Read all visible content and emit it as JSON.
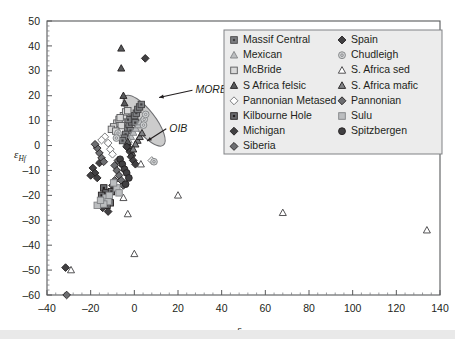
{
  "figure": {
    "type": "scatter-plot",
    "background": "#ffffff",
    "frame_color": "#58595b"
  },
  "chart_data": {
    "type": "scatter",
    "title": "",
    "xlabel": "εNd",
    "ylabel": "εHf",
    "xlabel_base": "ε",
    "xlabel_sub": "Nd",
    "ylabel_base": "ε",
    "ylabel_sub": "Hf",
    "xlim": [
      -40,
      140
    ],
    "ylim": [
      -60,
      50
    ],
    "xticks": [
      -40,
      -20,
      0,
      20,
      40,
      60,
      80,
      100,
      120,
      140
    ],
    "yticks": [
      -60,
      -50,
      -40,
      -30,
      -20,
      -10,
      0,
      10,
      20,
      30,
      40,
      50
    ],
    "xminor_step": 4,
    "yminor_step": 2,
    "grid": false,
    "legend_position": "top-right-inside",
    "annotations": [
      {
        "label": "MORB",
        "x": 28,
        "y": 21,
        "point_x": 9.5,
        "point_y": 18.5,
        "style": "italic"
      },
      {
        "label": "OIB",
        "x": 16,
        "y": 5.5,
        "point_x": 4.0,
        "point_y": 1.0,
        "style": "italic"
      }
    ],
    "shaded_field": {
      "name": "mantle-array-ellipse",
      "fill": "#c9c9c9",
      "stroke": "#6d6e71",
      "center_x": 4.5,
      "center_y": 10.0,
      "rx": 5.0,
      "ry": 12.5,
      "rotation_deg": -38
    },
    "series": [
      {
        "name": "Massif Central",
        "marker": "square-dot",
        "fill": "#808285",
        "stroke": "#414042",
        "points": [
          [
            -3,
            7
          ],
          [
            -2.4,
            8.5
          ],
          [
            -1.8,
            6
          ],
          [
            -1.2,
            9.5
          ],
          [
            -0.6,
            11
          ],
          [
            0.2,
            12
          ],
          [
            0.9,
            13
          ],
          [
            1.6,
            14.5
          ],
          [
            -4,
            4.5
          ],
          [
            -4.6,
            3
          ],
          [
            2.4,
            15.5
          ],
          [
            3.2,
            16.5
          ],
          [
            -5.4,
            2
          ],
          [
            -2.9,
            10.4
          ],
          [
            0.4,
            9.2
          ]
        ]
      },
      {
        "name": "Mexican",
        "marker": "triangle-light",
        "fill": "#bcbec0",
        "stroke": "#808285",
        "points": [
          [
            -1.5,
            3.5
          ],
          [
            -0.4,
            5.2
          ],
          [
            0.7,
            6.8
          ],
          [
            1.8,
            8.2
          ],
          [
            -2.6,
            2.2
          ],
          [
            2.8,
            9.4
          ],
          [
            -3.6,
            1.0
          ]
        ]
      },
      {
        "name": "McBride",
        "marker": "square-open",
        "fill": "#d9d9d9",
        "stroke": "#58595b",
        "points": [
          [
            -8,
            9
          ],
          [
            -7,
            10.5
          ],
          [
            -6,
            8
          ],
          [
            -9.5,
            7.5
          ],
          [
            -5,
            12
          ],
          [
            -4,
            13.5
          ],
          [
            -10.5,
            6.5
          ],
          [
            -3,
            14
          ],
          [
            -6.5,
            11.2
          ],
          [
            -8.5,
            5.8
          ]
        ]
      },
      {
        "name": "S Africa felsic",
        "marker": "triangle-dark",
        "fill": "#58595b",
        "stroke": "#231f20",
        "points": [
          [
            -6,
            39
          ],
          [
            -6,
            31
          ],
          [
            -5,
            20
          ],
          [
            -4.5,
            17
          ],
          [
            -3,
            1.5
          ],
          [
            -2,
            -1
          ],
          [
            -1,
            -3
          ]
        ]
      },
      {
        "name": "Pannonian Metased",
        "marker": "diamond-open",
        "fill": "#ffffff",
        "stroke": "#6d6e71",
        "points": [
          [
            -12,
            1
          ],
          [
            -13.5,
            3.5
          ],
          [
            -11,
            -1.5
          ],
          [
            8,
            -6
          ],
          [
            -15,
            2.2
          ],
          [
            -10,
            -3.5
          ]
        ]
      },
      {
        "name": "Kilbourne Hole",
        "marker": "square-dot-dark",
        "fill": "#6d6e71",
        "stroke": "#231f20",
        "points": [
          [
            -14,
            -17
          ],
          [
            -13,
            -19
          ],
          [
            -12,
            -21
          ],
          [
            -11,
            -23
          ],
          [
            -15,
            -20
          ],
          [
            -12.5,
            -24
          ],
          [
            -10.5,
            -18.5
          ]
        ]
      },
      {
        "name": "Michigan",
        "marker": "diamond-dark",
        "fill": "#414042",
        "stroke": "#231f20",
        "points": [
          [
            -19,
            -9
          ],
          [
            -18,
            -11
          ],
          [
            -17,
            -13
          ],
          [
            -16,
            -7
          ],
          [
            -20,
            -12
          ],
          [
            -13,
            -22
          ],
          [
            -14.5,
            -25
          ],
          [
            -12,
            -26.5
          ],
          [
            -31.5,
            -49
          ],
          [
            -10,
            -16
          ]
        ]
      },
      {
        "name": "Siberia",
        "marker": "diamond-mid",
        "fill": "#6d6e71",
        "stroke": "#231f20",
        "points": [
          [
            -16,
            -3
          ],
          [
            -15,
            -5
          ],
          [
            -17,
            -1
          ],
          [
            -14,
            -6.5
          ],
          [
            -18,
            0.5
          ],
          [
            -9,
            -14
          ]
        ]
      },
      {
        "name": "Spain",
        "marker": "diamond-dark",
        "fill": "#414042",
        "stroke": "#231f20",
        "points": [
          [
            5,
            35
          ],
          [
            -2,
            -2.5
          ],
          [
            -1.5,
            -4.5
          ],
          [
            -0.5,
            -6
          ],
          [
            0.5,
            -7.5
          ],
          [
            -3.5,
            -0.5
          ]
        ]
      },
      {
        "name": "Chudleigh",
        "marker": "circle-open",
        "fill": "#d1d3d4",
        "stroke": "#808285",
        "points": [
          [
            4.5,
            10.5
          ],
          [
            4.2,
            8.2
          ],
          [
            5.2,
            12.5
          ],
          [
            -7.5,
            5.0
          ],
          [
            9,
            -6.5
          ],
          [
            -8.2,
            3.0
          ]
        ]
      },
      {
        "name": "S. Africa sed",
        "marker": "triangle-open",
        "fill": "#ffffff",
        "stroke": "#414042",
        "points": [
          [
            20,
            -20
          ],
          [
            68,
            -27
          ],
          [
            134,
            -34
          ],
          [
            0,
            -43.5
          ],
          [
            -29,
            -50
          ],
          [
            -5,
            -21
          ],
          [
            3,
            -7.5
          ],
          [
            -3,
            -27.5
          ]
        ]
      },
      {
        "name": "S. Africa mafic",
        "marker": "triangle-dark",
        "fill": "#808285",
        "stroke": "#231f20",
        "points": [
          [
            1.5,
            2.0
          ],
          [
            2.5,
            3.5
          ],
          [
            0.5,
            0.5
          ],
          [
            3.5,
            5.0
          ],
          [
            -0.5,
            -1.5
          ]
        ]
      },
      {
        "name": "Pannonian",
        "marker": "diamond-mid",
        "fill": "#6d6e71",
        "stroke": "#231f20",
        "points": [
          [
            -9,
            -8
          ],
          [
            -8,
            -10
          ],
          [
            -7,
            -12
          ],
          [
            -6,
            -14
          ],
          [
            -5,
            -16
          ],
          [
            -7.5,
            -6
          ],
          [
            -31,
            -60
          ]
        ]
      },
      {
        "name": "Sulu",
        "marker": "square-light",
        "fill": "#bcbec0",
        "stroke": "#808285",
        "points": [
          [
            -13,
            -21
          ],
          [
            -12,
            -22.5
          ],
          [
            -14,
            -23.5
          ],
          [
            -11.5,
            -20
          ],
          [
            -17,
            -24
          ],
          [
            -15.5,
            -22
          ],
          [
            -8,
            -17
          ],
          [
            -9.5,
            -15
          ],
          [
            -7,
            -19
          ]
        ]
      },
      {
        "name": "Spitzbergen",
        "marker": "circle-dark",
        "fill": "#414042",
        "stroke": "#231f20",
        "points": [
          [
            -6.5,
            -5.5
          ],
          [
            -5.5,
            -7.5
          ],
          [
            -4.5,
            -9.5
          ],
          [
            -3.5,
            -11
          ],
          [
            -2.5,
            -13
          ],
          [
            -4,
            -15.5
          ]
        ]
      }
    ]
  },
  "legend": {
    "background": "#ececec",
    "border": "#808285",
    "entries": [
      {
        "label": "Massif Central",
        "marker": "square-dot",
        "col": 0,
        "row": 0
      },
      {
        "label": "Mexican",
        "marker": "triangle-light",
        "col": 0,
        "row": 1
      },
      {
        "label": "McBride",
        "marker": "square-open",
        "col": 0,
        "row": 2
      },
      {
        "label": "S Africa felsic",
        "marker": "triangle-dark",
        "col": 0,
        "row": 3
      },
      {
        "label": "Pannonian Metased",
        "marker": "diamond-open",
        "col": 0,
        "row": 4
      },
      {
        "label": "Kilbourne Hole",
        "marker": "square-dot-dark",
        "col": 0,
        "row": 5
      },
      {
        "label": "Michigan",
        "marker": "diamond-dark",
        "col": 0,
        "row": 6
      },
      {
        "label": "Siberia",
        "marker": "diamond-mid",
        "col": 0,
        "row": 7
      },
      {
        "label": "Spain",
        "marker": "diamond-dark",
        "col": 1,
        "row": 0
      },
      {
        "label": "Chudleigh",
        "marker": "circle-open",
        "col": 1,
        "row": 1
      },
      {
        "label": "S. Africa sed",
        "marker": "triangle-open",
        "col": 1,
        "row": 2
      },
      {
        "label": "S. Africa mafic",
        "marker": "triangle-dark",
        "col": 1,
        "row": 3
      },
      {
        "label": "Pannonian",
        "marker": "diamond-mid",
        "col": 1,
        "row": 4
      },
      {
        "label": "Sulu",
        "marker": "square-light",
        "col": 1,
        "row": 5
      },
      {
        "label": "Spitzbergen",
        "marker": "circle-dark",
        "col": 1,
        "row": 6
      }
    ]
  }
}
